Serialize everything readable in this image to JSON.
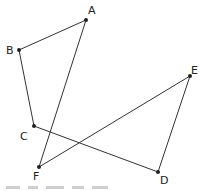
{
  "diagram": {
    "type": "polygon",
    "vertices": [
      {
        "id": "A",
        "x": 86,
        "y": 20,
        "lx": 88,
        "ly": 14
      },
      {
        "id": "B",
        "x": 19,
        "y": 50,
        "lx": 6,
        "ly": 54
      },
      {
        "id": "C",
        "x": 34,
        "y": 126,
        "lx": 20,
        "ly": 140
      },
      {
        "id": "D",
        "x": 158,
        "y": 172,
        "lx": 160,
        "ly": 184
      },
      {
        "id": "E",
        "x": 190,
        "y": 76,
        "lx": 191,
        "ly": 74
      },
      {
        "id": "F",
        "x": 39,
        "y": 167,
        "lx": 33,
        "ly": 180
      }
    ],
    "edges": [
      [
        "A",
        "B"
      ],
      [
        "B",
        "C"
      ],
      [
        "C",
        "D"
      ],
      [
        "D",
        "E"
      ],
      [
        "E",
        "F"
      ],
      [
        "F",
        "A"
      ]
    ],
    "labels": {
      "A": "A",
      "B": "B",
      "C": "C",
      "D": "D",
      "E": "E",
      "F": "F"
    }
  }
}
